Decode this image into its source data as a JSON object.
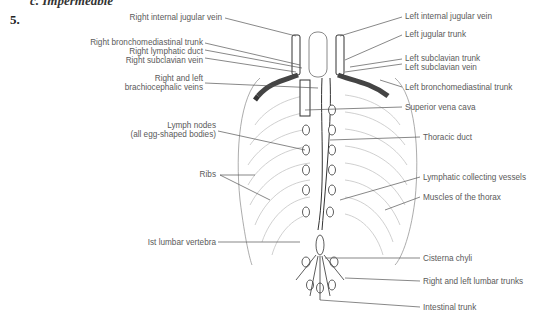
{
  "question": {
    "cut_off_line": "c. Impermeable",
    "number": "5."
  },
  "diagram": {
    "labels_left": [
      {
        "id": "right-internal-jugular-vein",
        "text": "Right internal jugular vein"
      },
      {
        "id": "right-bronchomediastinal-trunk",
        "text": "Right bronchomediastinal trunk"
      },
      {
        "id": "right-lymphatic-duct",
        "text": "Right lymphatic duct"
      },
      {
        "id": "right-subclavian-vein",
        "text": "Right subclavian vein"
      },
      {
        "id": "brachiocephalic-veins-1",
        "text": "Right and left"
      },
      {
        "id": "brachiocephalic-veins-2",
        "text": "brachiocephalic veins"
      },
      {
        "id": "lymph-nodes-1",
        "text": "Lymph nodes"
      },
      {
        "id": "lymph-nodes-2",
        "text": "(all egg-shaped bodies)"
      },
      {
        "id": "ribs",
        "text": "Ribs"
      },
      {
        "id": "first-lumbar-vertebra",
        "text": "Ist lumbar vertebra"
      }
    ],
    "labels_right": [
      {
        "id": "left-internal-jugular-vein",
        "text": "Left internal jugular vein"
      },
      {
        "id": "left-jugular-trunk",
        "text": "Left jugular trunk"
      },
      {
        "id": "left-subclavian-trunk",
        "text": "Left subclavian trunk"
      },
      {
        "id": "left-subclavian-vein",
        "text": "Left subclavian vein"
      },
      {
        "id": "left-bronchomediastinal-trunk",
        "text": "Left bronchomediastinal trunk"
      },
      {
        "id": "superior-vena-cava",
        "text": "Superior vena cava"
      },
      {
        "id": "thoracic-duct",
        "text": "Thoracic duct"
      },
      {
        "id": "lymphatic-collecting-vessels",
        "text": "Lymphatic collecting vessels"
      },
      {
        "id": "muscles-of-thorax",
        "text": "Muscles of the thorax"
      },
      {
        "id": "cisterna-chyli",
        "text": "Cisterna chyli"
      },
      {
        "id": "lumbar-trunks",
        "text": "Right and left lumbar trunks"
      },
      {
        "id": "intestinal-trunk",
        "text": "Intestinal trunk"
      }
    ]
  }
}
